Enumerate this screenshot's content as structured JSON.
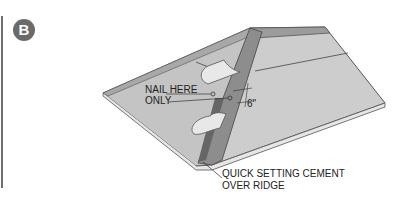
{
  "figure": {
    "badge": "B",
    "labels": {
      "nail_here_line1": "NAIL HERE",
      "nail_here_line2": "ONLY",
      "dimension": "6\"",
      "cement_line1": "QUICK SETTING CEMENT",
      "cement_line2": "OVER RIDGE"
    },
    "colors": {
      "roof": "#c9c9c9",
      "roof_dark": "#b5b5b5",
      "ridge": "#9a9a9a",
      "edge": "#555555",
      "strip_dark": "#6d6d6d"
    }
  }
}
